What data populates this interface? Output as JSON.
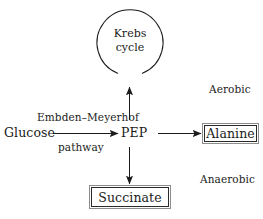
{
  "diagram": {
    "background_color": "#ffffff",
    "line_color": "#1b1b1b",
    "box_border_color": "#2a2a2a",
    "nodes": {
      "krebs": {
        "line1": "Krebs",
        "line2": "cycle"
      },
      "glucose": {
        "label": "Glucose"
      },
      "pep": {
        "label": "PEP"
      },
      "alanine": {
        "label": "Alanine"
      },
      "succinate": {
        "label": "Succinate"
      }
    },
    "edges": {
      "glucose_to_pep": {
        "label_above": "Embden–Meyerhof",
        "label_below": "pathway"
      }
    },
    "zones": {
      "aerobic": "Aerobic",
      "anaerobic": "Anaerobic"
    }
  }
}
